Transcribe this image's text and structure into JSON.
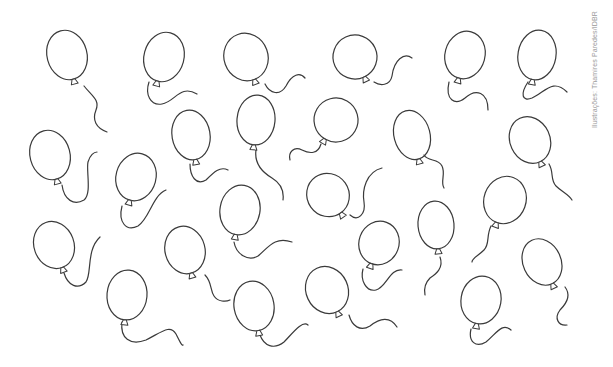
{
  "credit": {
    "text": "Ilustrações: Thamires Paredes/IDBR"
  },
  "style": {
    "stroke_color": "#3a3a3a",
    "background": "#ffffff",
    "credit_color": "#9a9a9a"
  },
  "balloons": [
    {
      "cx": 67,
      "cy": 55,
      "rx": 20,
      "ry": 25,
      "rot": -15,
      "string": "M84,86 C92,96 100,100 96,110 C92,120 96,128 107,132"
    },
    {
      "cx": 164,
      "cy": 57,
      "rx": 20,
      "ry": 25,
      "rot": 15,
      "string": "M149,82 C145,94 150,106 162,104 C175,102 180,84 197,94"
    },
    {
      "cx": 246,
      "cy": 57,
      "rx": 22,
      "ry": 24,
      "rot": -20,
      "string": "M265,84 C270,94 280,96 286,86 C292,74 300,72 305,78"
    },
    {
      "cx": 355,
      "cy": 57,
      "rx": 22,
      "ry": 22,
      "rot": -25,
      "string": "M374,82 C380,86 390,86 392,76 C394,60 404,52 412,58"
    },
    {
      "cx": 465,
      "cy": 55,
      "rx": 20,
      "ry": 24,
      "rot": 15,
      "string": "M449,82 C445,100 455,106 465,98 C476,88 488,92 488,110"
    },
    {
      "cx": 537,
      "cy": 55,
      "rx": 19,
      "ry": 25,
      "rot": 10,
      "string": "M528,82 C520,94 522,102 532,98 C545,92 553,78 567,92"
    },
    {
      "cx": 50,
      "cy": 155,
      "rx": 20,
      "ry": 25,
      "rot": -15,
      "string": "M62,185 C64,200 74,206 84,200 C92,194 86,170 88,162 C90,155 94,152 97,152"
    },
    {
      "cx": 136,
      "cy": 177,
      "rx": 20,
      "ry": 24,
      "rot": 15,
      "string": "M122,206 C118,222 126,232 138,226 C150,218 152,196 166,190"
    },
    {
      "cx": 191,
      "cy": 135,
      "rx": 19,
      "ry": 25,
      "rot": -10,
      "string": "M190,164 C190,176 196,186 206,180 C214,172 220,166 228,170"
    },
    {
      "cx": 256,
      "cy": 120,
      "rx": 19,
      "ry": 25,
      "rot": 5,
      "string": "M256,150 C254,164 262,172 272,178 C282,184 284,192 283,200"
    },
    {
      "cx": 336,
      "cy": 120,
      "rx": 22,
      "ry": 22,
      "rot": 30,
      "string": "M321,144 C318,154 310,154 302,150 C294,146 288,152 290,160"
    },
    {
      "cx": 412,
      "cy": 135,
      "rx": 18,
      "ry": 25,
      "rot": -15,
      "string": "M424,155 C428,162 438,158 442,166 C446,174 440,182 444,188"
    },
    {
      "cx": 530,
      "cy": 140,
      "rx": 20,
      "ry": 24,
      "rot": -25,
      "string": "M549,164 C554,172 550,180 556,186 C562,192 568,194 572,200"
    },
    {
      "cx": 328,
      "cy": 195,
      "rx": 21,
      "ry": 22,
      "rot": -35,
      "string": "M350,215 C358,222 366,214 364,202 C362,190 366,172 382,168"
    },
    {
      "cx": 240,
      "cy": 210,
      "rx": 20,
      "ry": 25,
      "rot": 10,
      "string": "M234,242 C236,254 248,262 258,256 C268,248 274,236 292,242"
    },
    {
      "cx": 505,
      "cy": 200,
      "rx": 21,
      "ry": 24,
      "rot": 20,
      "string": "M491,226 C486,236 490,244 484,250 C478,256 472,258 472,262"
    },
    {
      "cx": 436,
      "cy": 225,
      "rx": 18,
      "ry": 24,
      "rot": -5,
      "string": "M440,257 C444,268 436,274 430,278 C424,284 424,290 425,295"
    },
    {
      "cx": 379,
      "cy": 243,
      "rx": 20,
      "ry": 22,
      "rot": 20,
      "string": "M363,269 C360,280 366,292 376,290 C386,288 390,268 402,270"
    },
    {
      "cx": 54,
      "cy": 245,
      "rx": 20,
      "ry": 24,
      "rot": -20,
      "string": "M64,273 C68,286 78,290 86,282 C92,274 86,250 100,237"
    },
    {
      "cx": 185,
      "cy": 250,
      "rx": 20,
      "ry": 24,
      "rot": -15,
      "string": "M205,275 C212,282 210,290 214,296 C218,302 226,302 230,300"
    },
    {
      "cx": 542,
      "cy": 262,
      "rx": 19,
      "ry": 24,
      "rot": -25,
      "string": "M565,287 C572,296 566,304 560,310 C554,318 558,326 567,325"
    },
    {
      "cx": 127,
      "cy": 295,
      "rx": 20,
      "ry": 25,
      "rot": 5,
      "string": "M122,322 C120,338 130,346 146,340 C162,332 170,324 176,334 C180,342 182,346 183,345"
    },
    {
      "cx": 254,
      "cy": 306,
      "rx": 20,
      "ry": 25,
      "rot": -10,
      "string": "M260,335 C264,346 274,350 284,342 C292,334 302,320 308,325"
    },
    {
      "cx": 327,
      "cy": 290,
      "rx": 21,
      "ry": 24,
      "rot": -25,
      "string": "M349,315 C352,326 360,332 370,326 C380,318 390,316 397,327"
    },
    {
      "cx": 481,
      "cy": 300,
      "rx": 20,
      "ry": 24,
      "rot": 10,
      "string": "M471,329 C468,342 476,348 486,342 C496,334 502,322 511,330"
    }
  ]
}
